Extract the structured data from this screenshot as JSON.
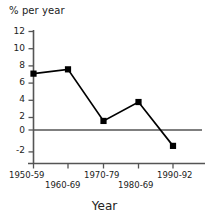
{
  "chart_data": {
    "type": "line",
    "title": "",
    "subtitle": "",
    "ylabel": "% per year",
    "xlabel": "Year",
    "categories": [
      "1950-59",
      "1960-69",
      "1970-79",
      "1980-69",
      "1990-92"
    ],
    "values": [
      7.1,
      7.6,
      1.6,
      3.8,
      -1.3
    ],
    "series": [
      {
        "name": "% per year",
        "values": [
          7.1,
          7.6,
          1.6,
          3.8,
          -1.3
        ]
      }
    ],
    "ylim": [
      -2,
      12
    ],
    "yticks": [
      "12",
      "10",
      "8",
      "6",
      "4",
      "2",
      "0",
      "-2"
    ],
    "ytick_values": [
      12,
      10,
      8,
      6,
      4,
      2,
      0,
      -2
    ],
    "xtick_labels": [
      "1950-59",
      "1960-69",
      "1970-79",
      "1980-69",
      "1990-92"
    ],
    "grid": false,
    "legend": "none",
    "zero_line": true,
    "marker": "square",
    "line_color": "#000000",
    "marker_color": "#000000",
    "axis_color": "#555555"
  },
  "axes": {
    "y_title": "% per year",
    "x_title": "Year"
  }
}
